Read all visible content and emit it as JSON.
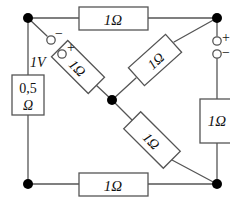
{
  "figure": {
    "name": "bridge-circuit-diagram",
    "width": 230,
    "height": 201,
    "background": "#ffffff",
    "line_color": "#555555",
    "node_color": "#000000",
    "text_color": "#111111"
  },
  "components": {
    "top_resistor": {
      "label": "1Ω",
      "orientation": "horizontal"
    },
    "bottom_resistor": {
      "label": "1Ω",
      "orientation": "horizontal"
    },
    "right_resistor": {
      "label": "1Ω",
      "orientation": "vertical"
    },
    "left_resistor": {
      "label_line1": "0,5",
      "label_line2": "Ω",
      "orientation": "vertical"
    },
    "upper_left_diagonal_resistor": {
      "label": "1Ω",
      "orientation": "diagonal"
    },
    "upper_right_diagonal_resistor": {
      "label": "1Ω",
      "orientation": "diagonal"
    },
    "lower_right_diagonal_resistor": {
      "label": "1Ω",
      "orientation": "diagonal"
    }
  },
  "sources": {
    "left_source": {
      "value": "1V",
      "terminal_top_sign": "−",
      "terminal_bottom_sign": "+"
    },
    "right_source": {
      "value": "1V",
      "terminal_top_sign": "+",
      "terminal_bottom_sign": "−"
    }
  },
  "nodes": {
    "top_left": "node-top-left",
    "top_right": "node-top-right",
    "center": "node-center",
    "bottom_left": "node-bottom-left",
    "bottom_right": "node-bottom-right"
  }
}
